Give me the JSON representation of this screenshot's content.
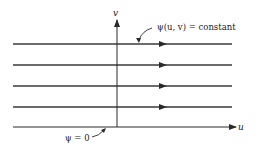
{
  "diagram": {
    "axis_labels": {
      "x": "u",
      "y": "v"
    },
    "streamline_label": "ψ(u, v) = constant",
    "baseline_label": "ψ = 0",
    "streamline_count": 4,
    "colors": {
      "line": "#2a2a2a",
      "background": "#ffffff"
    }
  }
}
